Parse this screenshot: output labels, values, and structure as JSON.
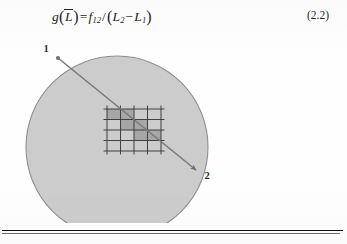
{
  "equation": {
    "lhs_function": "g",
    "lhs_arg": "L",
    "lhs_arg_overline": true,
    "equals": "=",
    "numerator": "f",
    "numerator_sub": "12",
    "divide": "/",
    "denom_first": "L",
    "denom_first_sub": "2",
    "minus": "−",
    "denom_second": "L",
    "denom_second_sub": "1",
    "full_text": "g(L̄) = f12 / (L2 − L1)",
    "number": "(2.2)"
  },
  "figure": {
    "name": "ray-through-circle-grid-diagram",
    "circle": {
      "cx": 117,
      "cy": 109,
      "r": 91,
      "fill": "#cccccc",
      "stroke": "#8f8f8f"
    },
    "ray": {
      "start_label": "1",
      "end_label": "2",
      "x1": 58,
      "y1": 20,
      "x2": 196,
      "y2": 132,
      "color": "#7a7a7a"
    },
    "labels": {
      "point_1": "1",
      "point_2": "2"
    },
    "grid": {
      "cols": 4,
      "rows": 4,
      "x": 107,
      "y": 71,
      "cell_w": 13.5,
      "cell_h": 10.5,
      "line_color": "#3a3a3a",
      "shade_color": "#a6a6a6",
      "shaded_cells": [
        [
          0,
          0
        ],
        [
          1,
          0
        ],
        [
          1,
          1
        ],
        [
          2,
          1
        ],
        [
          2,
          2
        ],
        [
          3,
          2
        ]
      ]
    }
  },
  "page": {
    "background": "#fefefe",
    "rule_color": "#0d0d0d"
  }
}
